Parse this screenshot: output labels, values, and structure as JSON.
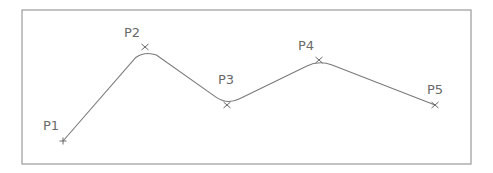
{
  "diagram": {
    "frame": {
      "x": 22,
      "y": 10,
      "width": 449,
      "height": 154,
      "stroke": "#9a9a9a"
    },
    "curve_color": "#7a7a7a",
    "marker_color": "#6a6a6a",
    "points": [
      {
        "label": "P1",
        "x": 63,
        "y": 141,
        "marker": "plus",
        "label_x": 43,
        "label_y": 130
      },
      {
        "label": "P2",
        "x": 145,
        "y": 47,
        "marker": "x",
        "label_x": 124,
        "label_y": 37
      },
      {
        "label": "P3",
        "x": 227,
        "y": 105,
        "marker": "x",
        "label_x": 218,
        "label_y": 84
      },
      {
        "label": "P4",
        "x": 319,
        "y": 60,
        "marker": "x",
        "label_x": 298,
        "label_y": 50
      },
      {
        "label": "P5",
        "x": 435,
        "y": 105,
        "marker": "x",
        "label_x": 427,
        "label_y": 94
      }
    ]
  }
}
